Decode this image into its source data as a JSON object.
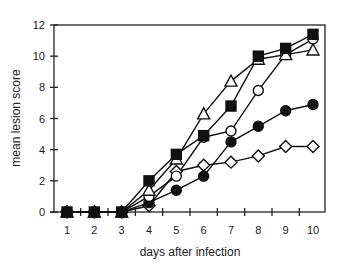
{
  "chart_data": {
    "type": "line",
    "title": "",
    "xlabel": "days after infection",
    "ylabel": "mean lesion score",
    "xlim": [
      0.5,
      10.5
    ],
    "ylim": [
      0,
      12
    ],
    "x": [
      1,
      2,
      3,
      4,
      5,
      6,
      7,
      8,
      9,
      10
    ],
    "x_ticks": [
      "1",
      "2",
      "3",
      "4",
      "5",
      "6",
      "7",
      "8",
      "9",
      "10"
    ],
    "y_ticks": [
      "0",
      "2",
      "4",
      "6",
      "8",
      "10",
      "12"
    ],
    "grid": false,
    "legend": null,
    "series": [
      {
        "name": "filled square",
        "marker": "square-filled",
        "values": [
          0,
          0,
          0,
          2.0,
          3.7,
          4.9,
          6.8,
          10.0,
          10.5,
          11.4
        ]
      },
      {
        "name": "open triangle",
        "marker": "triangle-open",
        "values": [
          0,
          0,
          0,
          1.4,
          3.4,
          6.3,
          8.4,
          9.8,
          10.1,
          10.4
        ]
      },
      {
        "name": "open circle",
        "marker": "circle-open",
        "values": [
          0,
          0,
          0,
          1.0,
          2.3,
          4.8,
          5.2,
          7.8,
          10.1,
          11.1
        ]
      },
      {
        "name": "filled circle",
        "marker": "circle-filled",
        "values": [
          0,
          0,
          0,
          0.6,
          1.4,
          2.3,
          4.5,
          5.5,
          6.5,
          6.9
        ]
      },
      {
        "name": "open diamond",
        "marker": "diamond-open",
        "values": [
          0,
          0,
          0,
          0.4,
          2.6,
          3.0,
          3.2,
          3.6,
          4.2,
          4.2
        ]
      }
    ]
  }
}
